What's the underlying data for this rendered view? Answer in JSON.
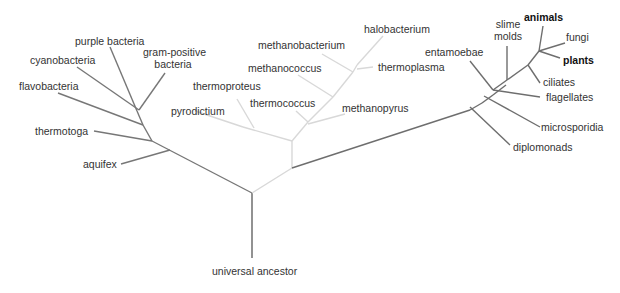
{
  "diagram": {
    "type": "phylogenetic-tree",
    "root_label": "universal ancestor",
    "colors": {
      "bacteria": "#777777",
      "archaea": "#d8d8d8",
      "eukarya": "#6e6e6e",
      "text": "#333333"
    },
    "bacteria": {
      "labels": {
        "purple_bacteria": "purple bacteria",
        "gram_positive_1": "gram-positive",
        "gram_positive_2": "bacteria",
        "cyanobacteria": "cyanobacteria",
        "flavobacteria": "flavobacteria",
        "thermotoga": "thermotoga",
        "aquifex": "aquifex"
      }
    },
    "archaea": {
      "labels": {
        "halobacterium": "halobacterium",
        "methanobacterium": "methanobacterium",
        "thermoplasma": "thermoplasma",
        "methanococcus": "methanococcus",
        "thermoproteus": "thermoproteus",
        "thermococcus": "thermococcus",
        "pyrodictium": "pyrodictium",
        "methanopyrus": "methanopyrus"
      }
    },
    "eukarya": {
      "labels": {
        "animals": "animals",
        "slime_molds_1": "slime",
        "slime_molds_2": "molds",
        "fungi": "fungi",
        "entamoebae": "entamoebae",
        "plants": "plants",
        "ciliates": "ciliates",
        "flagellates": "flagellates",
        "microsporidia": "microsporidia",
        "diplomonads": "diplomonads"
      }
    }
  }
}
